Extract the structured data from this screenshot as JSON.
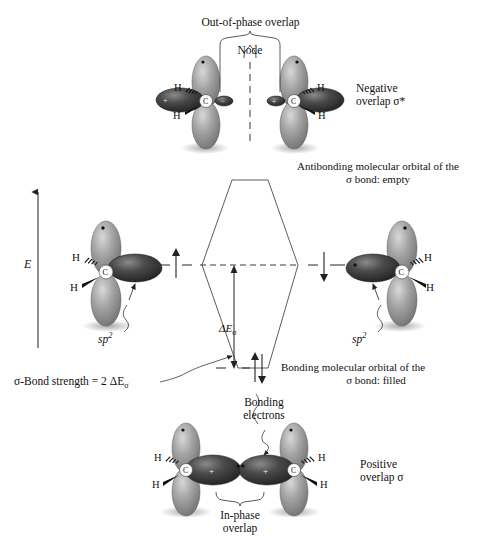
{
  "figure": {
    "title_hidden": "",
    "domain": "sigma bond molecular orbital energy diagram"
  },
  "labels": {
    "out_of_phase_overlap": "Out-of-phase overlap",
    "node": "Node",
    "negative_overlap_line1": "Negative",
    "negative_overlap_line2": "overlap σ*",
    "antibonding_line1": "Antibonding molecular orbital of the",
    "antibonding_line2": "σ bond: empty",
    "bonding_mo_line1": "Bonding molecular orbital of the",
    "bonding_mo_line2": "σ bond: filled",
    "bond_strength": "σ-Bond strength = 2 ΔEσ",
    "bond_strength_plain": "σ-Bond strength = 2 ΔE",
    "bond_strength_sub": "σ",
    "delta_e_sigma": "ΔE",
    "delta_e_sigma_sub": "σ",
    "energy_axis": "E",
    "sp2_left": "sp",
    "sp2_left_sup": "2",
    "sp2_right": "sp",
    "sp2_right_sup": "2",
    "bonding_electrons_line1": "Bonding",
    "bonding_electrons_line2": "electrons",
    "in_phase_line1": "In-phase",
    "in_phase_line2": "overlap",
    "positive_overlap_line1": "Positive",
    "positive_overlap_line2": "overlap σ",
    "hydrogen": "H",
    "carbon": "C",
    "plus": "+",
    "minus": "−"
  },
  "colors": {
    "ink": "#111111",
    "lobe_light": "#8e8e8e",
    "lobe_light_hi": "#c9c9c9",
    "lobe_dark": "#2b2b2b",
    "lobe_dark_hi": "#6a6a6a",
    "node_dash": "#9a9a9a",
    "line": "#3a3a3a",
    "shadow": "rgba(0,0,0,0.20)",
    "background": "#ffffff"
  },
  "diagram": {
    "levels": [
      {
        "name": "antibonding",
        "label": "antibonding molecular orbital",
        "occupancy": "empty",
        "electrons": 0
      },
      {
        "name": "atomic-sp2-left",
        "label": "sp2 atomic orbital (left)",
        "occupancy": "half-filled",
        "electrons": 1,
        "spin": "up"
      },
      {
        "name": "atomic-sp2-right",
        "label": "sp2 atomic orbital (right)",
        "occupancy": "half-filled",
        "electrons": 1,
        "spin": "down"
      },
      {
        "name": "bonding",
        "label": "bonding molecular orbital",
        "occupancy": "filled",
        "electrons": 2,
        "spin": "up-down"
      }
    ],
    "energy_gap": "ΔEσ",
    "bond_strength_value": "2 ΔEσ"
  },
  "orbitals": {
    "top": {
      "name": "out-of-phase-sp2-pair",
      "left_fragment": {
        "hydrogens": [
          "H",
          "H"
        ],
        "center": "C",
        "lobe_sign_inner": "+"
      },
      "right_fragment": {
        "hydrogens": [
          "H",
          "H"
        ],
        "center": "C",
        "lobe_sign_inner": "+"
      }
    },
    "bottom": {
      "name": "in-phase-sp2-pair",
      "left_fragment": {
        "hydrogens": [
          "H",
          "H"
        ],
        "center": "C",
        "lobe_sign_inner": "+"
      },
      "right_fragment": {
        "hydrogens": [
          "H",
          "H"
        ],
        "center": "C",
        "lobe_sign_inner": "+"
      }
    },
    "left_single": {
      "name": "sp2-orbital-left",
      "hydrogens": [
        "H",
        "H"
      ],
      "center": "C"
    },
    "right_single": {
      "name": "sp2-orbital-right",
      "hydrogens": [
        "H",
        "H"
      ],
      "center": "C"
    }
  }
}
